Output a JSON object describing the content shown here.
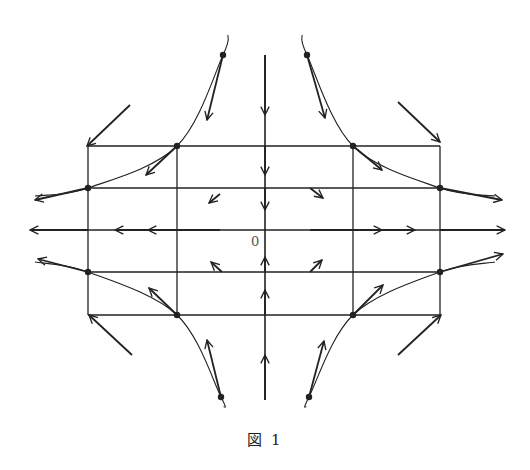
{
  "figure": {
    "caption": "図 1",
    "origin_label": "0",
    "stroke_color": "#222222"
  },
  "diagram": {
    "origin": [
      265,
      230
    ],
    "grid": {
      "vertical_x": [
        88,
        177,
        353,
        440
      ],
      "horizontal_y": [
        146,
        188,
        272,
        315
      ],
      "vertical_extent": [
        146,
        315
      ],
      "horizontal_extent": [
        88,
        440
      ]
    },
    "axes": {
      "horizontal": {
        "from": [
          30,
          230
        ],
        "to": [
          505,
          230
        ],
        "direction": "outward"
      },
      "vertical": {
        "from": [
          265,
          55
        ],
        "to": [
          265,
          400
        ],
        "direction": "inward"
      }
    },
    "curve_points": [
      {
        "quadrant": "upper-left",
        "points": [
          [
            228,
            35
          ],
          [
            223,
            55
          ],
          [
            177,
            146
          ],
          [
            88,
            188
          ],
          [
            35,
            196
          ]
        ]
      },
      {
        "quadrant": "upper-right",
        "points": [
          [
            302,
            35
          ],
          [
            307,
            55
          ],
          [
            353,
            146
          ],
          [
            440,
            188
          ],
          [
            495,
            196
          ]
        ]
      },
      {
        "quadrant": "lower-left",
        "points": [
          [
            224,
            407
          ],
          [
            221,
            397
          ],
          [
            177,
            315
          ],
          [
            88,
            272
          ],
          [
            35,
            262
          ]
        ]
      },
      {
        "quadrant": "lower-right",
        "points": [
          [
            306,
            407
          ],
          [
            309,
            397
          ],
          [
            353,
            315
          ],
          [
            440,
            272
          ],
          [
            495,
            262
          ]
        ]
      }
    ],
    "arrows": [
      {
        "from": [
          265,
          55
        ],
        "to": [
          265,
          115
        ]
      },
      {
        "from": [
          265,
          146
        ],
        "to": [
          265,
          175
        ]
      },
      {
        "from": [
          265,
          188
        ],
        "to": [
          265,
          210
        ]
      },
      {
        "from": [
          265,
          400
        ],
        "to": [
          265,
          355
        ]
      },
      {
        "from": [
          265,
          315
        ],
        "to": [
          265,
          290
        ]
      },
      {
        "from": [
          265,
          272
        ],
        "to": [
          265,
          257
        ]
      },
      {
        "from": [
          88,
          230
        ],
        "to": [
          30,
          230
        ]
      },
      {
        "from": [
          177,
          230
        ],
        "to": [
          115,
          230
        ]
      },
      {
        "from": [
          220,
          230
        ],
        "to": [
          148,
          230
        ]
      },
      {
        "from": [
          310,
          230
        ],
        "to": [
          382,
          230
        ]
      },
      {
        "from": [
          353,
          230
        ],
        "to": [
          415,
          230
        ]
      },
      {
        "from": [
          440,
          230
        ],
        "to": [
          505,
          230
        ]
      },
      {
        "from": [
          223,
          55
        ],
        "to": [
          207,
          120
        ]
      },
      {
        "from": [
          177,
          146
        ],
        "to": [
          146,
          175
        ]
      },
      {
        "from": [
          88,
          188
        ],
        "to": [
          35,
          200
        ]
      },
      {
        "from": [
          307,
          55
        ],
        "to": [
          325,
          118
        ]
      },
      {
        "from": [
          353,
          146
        ],
        "to": [
          382,
          170
        ]
      },
      {
        "from": [
          440,
          188
        ],
        "to": [
          502,
          200
        ]
      },
      {
        "from": [
          221,
          397
        ],
        "to": [
          207,
          340
        ]
      },
      {
        "from": [
          177,
          315
        ],
        "to": [
          149,
          288
        ]
      },
      {
        "from": [
          88,
          272
        ],
        "to": [
          38,
          259
        ]
      },
      {
        "from": [
          309,
          397
        ],
        "to": [
          324,
          341
        ]
      },
      {
        "from": [
          353,
          315
        ],
        "to": [
          383,
          285
        ]
      },
      {
        "from": [
          440,
          272
        ],
        "to": [
          503,
          254
        ]
      },
      {
        "from": [
          220,
          194
        ],
        "to": [
          209,
          203
        ]
      },
      {
        "from": [
          310,
          188
        ],
        "to": [
          323,
          198
        ]
      },
      {
        "from": [
          222,
          272
        ],
        "to": [
          211,
          262
        ]
      },
      {
        "from": [
          310,
          272
        ],
        "to": [
          322,
          260
        ]
      },
      {
        "from": [
          130,
          105
        ],
        "to": [
          87,
          146
        ]
      },
      {
        "from": [
          398,
          102
        ],
        "to": [
          440,
          142
        ]
      },
      {
        "from": [
          132,
          355
        ],
        "to": [
          89,
          315
        ]
      },
      {
        "from": [
          398,
          355
        ],
        "to": [
          441,
          315
        ]
      }
    ]
  }
}
